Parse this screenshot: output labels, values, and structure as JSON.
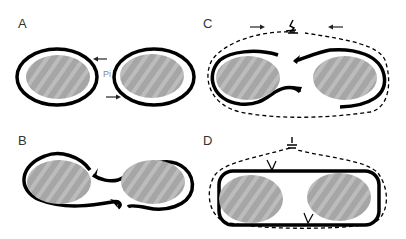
{
  "figure": {
    "panels": [
      {
        "id": "A",
        "label": "A",
        "annotation": "Pi"
      },
      {
        "id": "B",
        "label": "B"
      },
      {
        "id": "C",
        "label": "C"
      },
      {
        "id": "D",
        "label": "D"
      }
    ]
  },
  "colors": {
    "outline": "#000000",
    "nucleus_fill": "#a8a8a8",
    "nucleus_stripe": "#bdbdbd",
    "background": "#ffffff"
  }
}
